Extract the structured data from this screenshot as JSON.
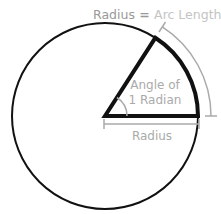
{
  "title": {
    "part1": "Radius",
    "equals": " = ",
    "part2": "Arc Length"
  },
  "angle_label": {
    "line1": "Angle of",
    "line2": "1 Radian"
  },
  "radius_label": "Radius",
  "colors": {
    "stroke": "#111111",
    "gray": "#aaaaaa",
    "title_dark": "#999999",
    "title_light": "#c4c4c4"
  }
}
